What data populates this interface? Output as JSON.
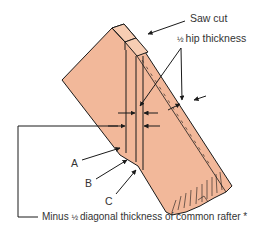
{
  "diagram": {
    "labels": {
      "saw_cut": "Saw cut",
      "half_hip_fraction": "½",
      "half_hip_text": " hip thickness",
      "a": "A",
      "b": "B",
      "c": "C",
      "bottom_prefix": "Minus ",
      "bottom_fraction": "½",
      "bottom_text": " diagonal thickness of common rafter ",
      "bottom_asterisk": "*"
    },
    "colors": {
      "wood_fill": "#f2b89a",
      "wood_top_fill": "#f7cdb3",
      "line": "#1a1a1a",
      "text": "#333333",
      "background": "#ffffff"
    }
  }
}
